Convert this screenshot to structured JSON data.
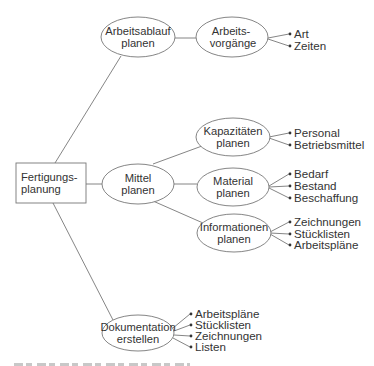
{
  "diagram": {
    "stroke_color": "#777777",
    "text_color": "#333333",
    "root": {
      "line1": "Fertigungs-",
      "line2": "planung"
    },
    "nodes": {
      "arbeitsablauf": {
        "line1": "Arbeitsablauf",
        "line2": "planen"
      },
      "arbeitsvorgaenge": {
        "line1": "Arbeits-",
        "line2": "vorgänge"
      },
      "mittel": {
        "line1": "Mittel",
        "line2": "planen"
      },
      "kapazitaeten": {
        "line1": "Kapazitäten",
        "line2": "planen"
      },
      "material": {
        "line1": "Material",
        "line2": "planen"
      },
      "informationen": {
        "line1": "Informationen",
        "line2": "planen"
      },
      "dokumentation": {
        "line1": "Dokumentation",
        "line2": "erstellen"
      }
    },
    "leaves": {
      "arbeitsvorgaenge": [
        "Art",
        "Zeiten"
      ],
      "kapazitaeten": [
        "Personal",
        "Betriebsmittel"
      ],
      "material": [
        "Bedarf",
        "Bestand",
        "Beschaffung"
      ],
      "informationen": [
        "Zeichnungen",
        "Stücklisten",
        "Arbeitspläne"
      ],
      "dokumentation": [
        "Arbeitspläne",
        "Stücklisten",
        "Zeichnungen",
        "Listen"
      ]
    }
  }
}
